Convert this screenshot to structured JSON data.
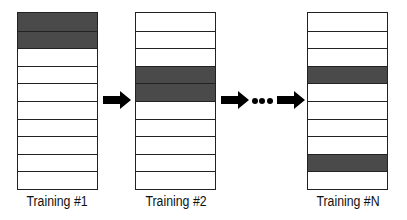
{
  "diagram": {
    "rows_per_stack": 10,
    "shade_color": "#4a4a4a",
    "stacks": [
      {
        "label": "Training #1",
        "shaded_rows": [
          0,
          1
        ]
      },
      {
        "label": "Training #2",
        "shaded_rows": [
          3,
          4
        ]
      },
      {
        "label": "Training #N",
        "shaded_rows": [
          3,
          8
        ]
      }
    ],
    "ellipsis": "..."
  }
}
